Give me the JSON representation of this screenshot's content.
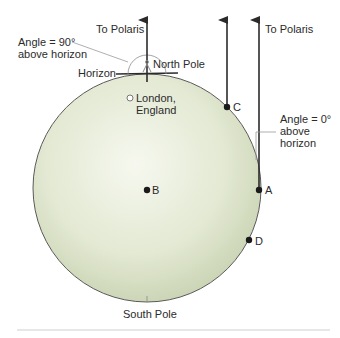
{
  "diagram": {
    "type": "earth-polaris-angle",
    "colors": {
      "earth_fill_center": "#f4f7ec",
      "earth_fill_edge": "#c9d3b3",
      "earth_outline": "#5a5a5a",
      "arrow": "#2b2b2b",
      "text": "#2b2b2b",
      "leader_line": "#9a9a9a",
      "footer_rule": "#cfcfcf"
    },
    "labels": {
      "to_polaris_left": "To Polaris",
      "to_polaris_right": "To Polaris",
      "angle_90_line1": "Angle = 90°",
      "angle_90_line2": "above horizon",
      "horizon": "Horizon",
      "north_pole": "North Pole",
      "london_line1": "London,",
      "london_line2": "England",
      "point_a": "A",
      "point_b": "B",
      "point_c": "C",
      "point_d": "D",
      "angle_0_line1": "Angle = 0°",
      "angle_0_line2": "above",
      "angle_0_line3": "horizon",
      "south_pole": "South Pole"
    }
  }
}
